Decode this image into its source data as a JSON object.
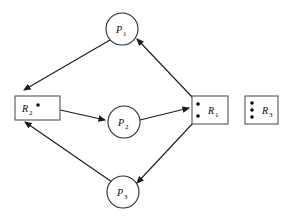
{
  "diagram": {
    "type": "resource-allocation-graph",
    "colors": {
      "background": "#ffffff",
      "node_stroke": "#2b2b2b",
      "box_stroke": "#555555",
      "edge": "#1a1a1a",
      "dot": "#0a0a0a"
    },
    "processes": [
      {
        "id": "P1",
        "label": "P",
        "sub": "1",
        "cx": 122,
        "cy": 29,
        "r": 16
      },
      {
        "id": "P2",
        "label": "P",
        "sub": "2",
        "cx": 124,
        "cy": 122,
        "r": 16
      },
      {
        "id": "P3",
        "label": "P",
        "sub": "3",
        "cx": 123,
        "cy": 192,
        "r": 16
      }
    ],
    "resources": [
      {
        "id": "R1",
        "label": "R",
        "sub": "1",
        "x": 192,
        "y": 96,
        "w": 36,
        "h": 28,
        "instances": 2
      },
      {
        "id": "R2",
        "label": "R",
        "sub": "2",
        "x": 15,
        "y": 96,
        "w": 45,
        "h": 24,
        "instances": 1
      },
      {
        "id": "R3",
        "label": "R",
        "sub": "3",
        "x": 245,
        "y": 96,
        "w": 33,
        "h": 28,
        "instances": 3
      }
    ],
    "edges": [
      {
        "id": "e1",
        "from": "P1",
        "to": "R2",
        "kind": "request",
        "d": "M 110 40 L 22 92"
      },
      {
        "id": "e2",
        "from": "R1",
        "to": "P1",
        "kind": "assignment",
        "d": "M 196 98 L 136 38"
      },
      {
        "id": "e3",
        "from": "R2",
        "to": "P2",
        "kind": "assignment",
        "d": "M 38 104 L 107 120"
      },
      {
        "id": "e4",
        "from": "P2",
        "to": "R1",
        "kind": "request",
        "d": "M 140 120 L 190 108"
      },
      {
        "id": "e5",
        "from": "P3",
        "to": "R2",
        "kind": "request",
        "d": "M 112 182 L 23 120"
      },
      {
        "id": "e6",
        "from": "R1",
        "to": "P3",
        "kind": "assignment",
        "d": "M 196 122 L 136 184"
      }
    ]
  }
}
